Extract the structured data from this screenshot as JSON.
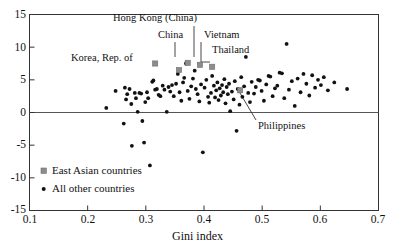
{
  "chart_data": {
    "type": "scatter",
    "title": "",
    "xlabel": "Gini index",
    "ylabel": "",
    "xlim": [
      0.1,
      0.7
    ],
    "ylim": [
      -15,
      15
    ],
    "xticks": [
      "0.1",
      "0.2",
      "0.3",
      "0.4",
      "0.5",
      "0.6",
      "0.7"
    ],
    "xtick_values": [
      0.1,
      0.2,
      0.3,
      0.4,
      0.5,
      0.6,
      0.7
    ],
    "yticks": [
      "15",
      "10",
      "5",
      "0",
      "-5",
      "-10",
      "-15"
    ],
    "ytick_values": [
      15,
      10,
      5,
      0,
      -5,
      -10,
      -15
    ],
    "grid": false,
    "zero_line": true,
    "legend_position": "lower-left-inside",
    "series": [
      {
        "name": "East Asian countries",
        "marker": "square",
        "color": "#8c8c8c",
        "points": [
          {
            "label": "Korea, Rep. of",
            "x": 0.316,
            "y": 7.5
          },
          {
            "label": "China",
            "x": 0.372,
            "y": 7.6
          },
          {
            "label": "Hong Kong (China)",
            "x": 0.393,
            "y": 7.3
          },
          {
            "label": "Vietnam",
            "x": 0.357,
            "y": 6.5
          },
          {
            "label": "Thailand",
            "x": 0.414,
            "y": 7.0
          },
          {
            "label": "Philippines",
            "x": 0.462,
            "y": 3.4
          }
        ]
      },
      {
        "name": "All other countries",
        "marker": "dot",
        "color": "#111111",
        "points": [
          {
            "x": 0.232,
            "y": 0.7
          },
          {
            "x": 0.248,
            "y": 3.3
          },
          {
            "x": 0.262,
            "y": -1.7
          },
          {
            "x": 0.264,
            "y": 3.8
          },
          {
            "x": 0.266,
            "y": 2.0
          },
          {
            "x": 0.268,
            "y": 2.8
          },
          {
            "x": 0.272,
            "y": 3.6
          },
          {
            "x": 0.275,
            "y": 1.3
          },
          {
            "x": 0.276,
            "y": -5.1
          },
          {
            "x": 0.281,
            "y": 3.0
          },
          {
            "x": 0.283,
            "y": 2.2
          },
          {
            "x": 0.286,
            "y": 0.1
          },
          {
            "x": 0.289,
            "y": 3.0
          },
          {
            "x": 0.292,
            "y": 2.9
          },
          {
            "x": 0.294,
            "y": -1.3
          },
          {
            "x": 0.297,
            "y": -4.6
          },
          {
            "x": 0.299,
            "y": 1.6
          },
          {
            "x": 0.302,
            "y": 3.1
          },
          {
            "x": 0.304,
            "y": 2.2
          },
          {
            "x": 0.307,
            "y": -8.1
          },
          {
            "x": 0.311,
            "y": 4.7
          },
          {
            "x": 0.313,
            "y": 4.9
          },
          {
            "x": 0.316,
            "y": 3.5
          },
          {
            "x": 0.319,
            "y": 3.6
          },
          {
            "x": 0.322,
            "y": 2.7
          },
          {
            "x": 0.325,
            "y": 2.5
          },
          {
            "x": 0.329,
            "y": 4.1
          },
          {
            "x": 0.332,
            "y": 3.5
          },
          {
            "x": 0.336,
            "y": 0.1
          },
          {
            "x": 0.339,
            "y": 3.9
          },
          {
            "x": 0.342,
            "y": 3.2
          },
          {
            "x": 0.345,
            "y": 4.2
          },
          {
            "x": 0.348,
            "y": 2.5
          },
          {
            "x": 0.352,
            "y": 4.4
          },
          {
            "x": 0.355,
            "y": 5.9
          },
          {
            "x": 0.358,
            "y": 3.1
          },
          {
            "x": 0.361,
            "y": 1.8
          },
          {
            "x": 0.364,
            "y": 4.6
          },
          {
            "x": 0.366,
            "y": 5.3
          },
          {
            "x": 0.369,
            "y": 7.5
          },
          {
            "x": 0.372,
            "y": 3.3
          },
          {
            "x": 0.375,
            "y": 2.1
          },
          {
            "x": 0.378,
            "y": 4.0
          },
          {
            "x": 0.381,
            "y": 5.2
          },
          {
            "x": 0.384,
            "y": 6.4
          },
          {
            "x": 0.386,
            "y": 3.6
          },
          {
            "x": 0.389,
            "y": 2.8
          },
          {
            "x": 0.392,
            "y": 1.7
          },
          {
            "x": 0.395,
            "y": 4.3
          },
          {
            "x": 0.398,
            "y": -6.1
          },
          {
            "x": 0.401,
            "y": 3.8
          },
          {
            "x": 0.404,
            "y": 5.0
          },
          {
            "x": 0.407,
            "y": 2.4
          },
          {
            "x": 0.409,
            "y": 1.5
          },
          {
            "x": 0.412,
            "y": 3.0
          },
          {
            "x": 0.414,
            "y": 5.6
          },
          {
            "x": 0.417,
            "y": 4.1
          },
          {
            "x": 0.419,
            "y": 2.3
          },
          {
            "x": 0.421,
            "y": 3.4
          },
          {
            "x": 0.423,
            "y": 4.6
          },
          {
            "x": 0.425,
            "y": 1.9
          },
          {
            "x": 0.427,
            "y": 3.7
          },
          {
            "x": 0.429,
            "y": 2.6
          },
          {
            "x": 0.431,
            "y": 4.2
          },
          {
            "x": 0.433,
            "y": 3.1
          },
          {
            "x": 0.435,
            "y": 5.1
          },
          {
            "x": 0.437,
            "y": 1.4
          },
          {
            "x": 0.439,
            "y": 3.9
          },
          {
            "x": 0.441,
            "y": 2.8
          },
          {
            "x": 0.443,
            "y": 4.4
          },
          {
            "x": 0.445,
            "y": 0.2
          },
          {
            "x": 0.448,
            "y": 3.2
          },
          {
            "x": 0.451,
            "y": 2.0
          },
          {
            "x": 0.453,
            "y": 4.8
          },
          {
            "x": 0.456,
            "y": -2.8
          },
          {
            "x": 0.458,
            "y": 3.6
          },
          {
            "x": 0.461,
            "y": 1.2
          },
          {
            "x": 0.464,
            "y": 5.4
          },
          {
            "x": 0.466,
            "y": 2.4
          },
          {
            "x": 0.469,
            "y": 4.0
          },
          {
            "x": 0.472,
            "y": 8.5
          },
          {
            "x": 0.476,
            "y": 3.0
          },
          {
            "x": 0.479,
            "y": 1.6
          },
          {
            "x": 0.482,
            "y": 4.7
          },
          {
            "x": 0.486,
            "y": 2.9
          },
          {
            "x": 0.489,
            "y": 3.9
          },
          {
            "x": 0.493,
            "y": 5.0
          },
          {
            "x": 0.496,
            "y": 4.9
          },
          {
            "x": 0.499,
            "y": 3.3
          },
          {
            "x": 0.503,
            "y": 1.8
          },
          {
            "x": 0.507,
            "y": 4.3
          },
          {
            "x": 0.511,
            "y": 5.6
          },
          {
            "x": 0.514,
            "y": 5.5
          },
          {
            "x": 0.518,
            "y": 2.5
          },
          {
            "x": 0.522,
            "y": 3.7
          },
          {
            "x": 0.526,
            "y": 4.1
          },
          {
            "x": 0.53,
            "y": 6.1
          },
          {
            "x": 0.534,
            "y": 6.0
          },
          {
            "x": 0.538,
            "y": 2.2
          },
          {
            "x": 0.542,
            "y": 10.5
          },
          {
            "x": 0.546,
            "y": 3.5
          },
          {
            "x": 0.551,
            "y": 4.8
          },
          {
            "x": 0.556,
            "y": 1.0
          },
          {
            "x": 0.561,
            "y": 5.2
          },
          {
            "x": 0.566,
            "y": 3.1
          },
          {
            "x": 0.571,
            "y": 5.9
          },
          {
            "x": 0.576,
            "y": 4.4
          },
          {
            "x": 0.581,
            "y": 2.6
          },
          {
            "x": 0.586,
            "y": 5.7
          },
          {
            "x": 0.591,
            "y": 3.8
          },
          {
            "x": 0.596,
            "y": 5.0
          },
          {
            "x": 0.601,
            "y": 4.2
          },
          {
            "x": 0.606,
            "y": 5.4
          },
          {
            "x": 0.613,
            "y": 3.4
          },
          {
            "x": 0.624,
            "y": 4.6
          },
          {
            "x": 0.646,
            "y": 3.6
          }
        ]
      }
    ],
    "annotations": [
      {
        "name": "Hong Kong (China)",
        "text": "Hong Kong (China)",
        "text_x": 113,
        "text_y": 12,
        "leader": [
          [
            194,
            26
          ],
          [
            194,
            57
          ]
        ]
      },
      {
        "name": "China",
        "text": "China",
        "text_x": 158,
        "text_y": 29,
        "leader": [
          [
            175,
            42
          ],
          [
            175,
            57
          ]
        ]
      },
      {
        "name": "Vietnam",
        "text": "Vietnam",
        "text_x": 204,
        "text_y": 29,
        "leader": [
          [
            201,
            42
          ],
          [
            201,
            62
          ],
          [
            210,
            62
          ]
        ]
      },
      {
        "name": "Thailand",
        "text": "Thailand",
        "text_x": 212,
        "text_y": 44,
        "leader": null
      },
      {
        "name": "Korea, Rep. of",
        "text": "Korea, Rep. of",
        "text_x": 71,
        "text_y": 52,
        "leader": null
      },
      {
        "name": "Philippines",
        "text": "Philippines",
        "text_x": 258,
        "text_y": 122,
        "leader": [
          [
            256,
            120
          ],
          [
            237,
            88
          ]
        ]
      }
    ],
    "legend_entries": [
      {
        "label": "East Asian countries",
        "marker": "square",
        "color": "#8c8c8c"
      },
      {
        "label": "All other countries",
        "marker": "dot",
        "color": "#111111"
      }
    ]
  }
}
